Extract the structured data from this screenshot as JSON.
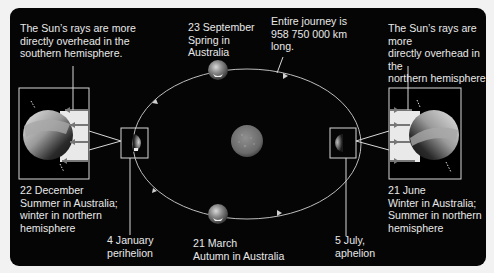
{
  "labels": {
    "left_callout": "The Sun’s rays are more\ndirectly overhead in the\nsouthern hemisphere.",
    "right_callout": "The Sun’s rays are more\ndirectly overhead in the\nnorthern hemisphere.",
    "september": "23 September\nSpring in\nAustralia",
    "journey": "Entire journey is\n958 750 000 km\nlong.",
    "december": "22 December\nSummer in Australia;\nwinter in northern\nhemisphere",
    "june": "21 June\nWinter in Australia;\nSummer in northern\nhemisphere",
    "january": "4 January\nperihelion",
    "march": "21 March\nAutumn in Australia",
    "july": "5 July,\naphelion"
  },
  "colors": {
    "background": "#f2f2f2",
    "panel": "#050505",
    "text": "#e8e8e8",
    "orbit": "#bdbdbd",
    "box_stroke": "#d8d8d8"
  },
  "diagram": {
    "type": "earth-orbit-seasons",
    "orbit_distance_km": 958750000,
    "positions": [
      {
        "date": "22 December",
        "season_au": "Summer",
        "note": "winter in northern hemisphere",
        "side": "left"
      },
      {
        "date": "4 January",
        "event": "perihelion",
        "side": "left"
      },
      {
        "date": "23 September",
        "season_au": "Spring",
        "side": "top"
      },
      {
        "date": "21 March",
        "season_au": "Autumn",
        "side": "bottom"
      },
      {
        "date": "21 June",
        "season_au": "Winter",
        "note": "Summer in northern hemisphere",
        "side": "right"
      },
      {
        "date": "5 July",
        "event": "aphelion",
        "side": "right"
      }
    ]
  }
}
